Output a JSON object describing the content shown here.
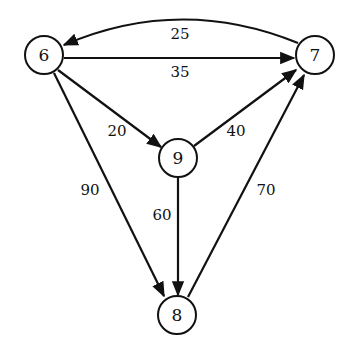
{
  "graph": {
    "type": "directed-weighted",
    "nodes": [
      {
        "id": "6",
        "label": "6",
        "x": 44,
        "y": 55
      },
      {
        "id": "7",
        "label": "7",
        "x": 315,
        "y": 55
      },
      {
        "id": "9",
        "label": "9",
        "x": 178,
        "y": 158
      },
      {
        "id": "8",
        "label": "8",
        "x": 177,
        "y": 315
      }
    ],
    "edges": [
      {
        "from": "7",
        "to": "6",
        "weight": "25",
        "curved": true
      },
      {
        "from": "6",
        "to": "7",
        "weight": "35"
      },
      {
        "from": "6",
        "to": "9",
        "weight": "20"
      },
      {
        "from": "9",
        "to": "7",
        "weight": "40"
      },
      {
        "from": "6",
        "to": "8",
        "weight": "90"
      },
      {
        "from": "9",
        "to": "8",
        "weight": "60"
      },
      {
        "from": "8",
        "to": "7",
        "weight": "70"
      }
    ]
  }
}
